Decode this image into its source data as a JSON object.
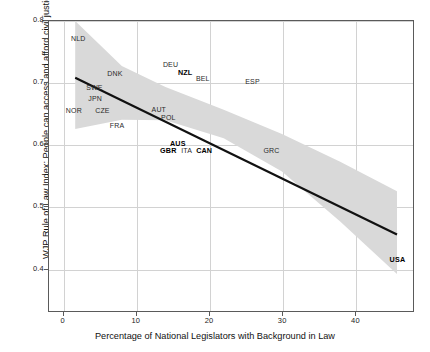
{
  "chart_data": {
    "type": "scatter",
    "title": "",
    "xlabel": "Percentage of National Legislators with Background in Law",
    "ylabel": "WJP Rule of Law Index: People can access and afford civil justice",
    "xlim": [
      -2,
      48
    ],
    "ylim": [
      0.33,
      0.8
    ],
    "xticks": [
      "0",
      "10",
      "20",
      "30",
      "40"
    ],
    "xtick_values": [
      0,
      10,
      20,
      30,
      40
    ],
    "yticks": [
      "0.8",
      "0.7",
      "0.6",
      "0.5",
      "0.4"
    ],
    "ytick_values": [
      0.8,
      0.7,
      0.6,
      0.5,
      0.4
    ],
    "grid": true,
    "legend": "none",
    "points": [
      {
        "label": "NLD",
        "x": 2.0,
        "y": 0.773,
        "bold": false
      },
      {
        "label": "DNK",
        "x": 7.0,
        "y": 0.717,
        "bold": false
      },
      {
        "label": "SWE",
        "x": 4.2,
        "y": 0.693,
        "bold": false
      },
      {
        "label": "JPN",
        "x": 4.3,
        "y": 0.676,
        "bold": false
      },
      {
        "label": "NOR",
        "x": 1.4,
        "y": 0.657,
        "bold": false
      },
      {
        "label": "CZE",
        "x": 5.3,
        "y": 0.657,
        "bold": false
      },
      {
        "label": "FRA",
        "x": 7.3,
        "y": 0.633,
        "bold": false
      },
      {
        "label": "DEU",
        "x": 14.6,
        "y": 0.731,
        "bold": false
      },
      {
        "label": "NZL",
        "x": 16.6,
        "y": 0.718,
        "bold": true
      },
      {
        "label": "BEL",
        "x": 19.0,
        "y": 0.709,
        "bold": false
      },
      {
        "label": "ESP",
        "x": 25.8,
        "y": 0.703,
        "bold": false
      },
      {
        "label": "AUT",
        "x": 13.0,
        "y": 0.658,
        "bold": false
      },
      {
        "label": "POL",
        "x": 14.3,
        "y": 0.645,
        "bold": false
      },
      {
        "label": "AUS",
        "x": 15.6,
        "y": 0.604,
        "bold": true
      },
      {
        "label": "GBR",
        "x": 14.3,
        "y": 0.593,
        "bold": true
      },
      {
        "label": "ITA",
        "x": 16.8,
        "y": 0.593,
        "bold": false
      },
      {
        "label": "CAN",
        "x": 19.2,
        "y": 0.593,
        "bold": true
      },
      {
        "label": "GRC",
        "x": 28.4,
        "y": 0.592,
        "bold": false
      },
      {
        "label": "USA",
        "x": 45.6,
        "y": 0.417,
        "bold": true
      }
    ],
    "fit_line": {
      "name": "linear-regression",
      "x_start": 1.6,
      "y_start": 0.708,
      "x_end": 45.8,
      "y_end": 0.454,
      "color": "#111111"
    },
    "confidence_band": {
      "name": "confidence-interval",
      "color": "#d9d9d9",
      "upper": [
        {
          "x": 1.6,
          "y": 0.8
        },
        {
          "x": 8.0,
          "y": 0.727
        },
        {
          "x": 14.0,
          "y": 0.693
        },
        {
          "x": 22.0,
          "y": 0.656
        },
        {
          "x": 30.0,
          "y": 0.617
        },
        {
          "x": 38.0,
          "y": 0.572
        },
        {
          "x": 45.8,
          "y": 0.524
        }
      ],
      "lower": [
        {
          "x": 1.6,
          "y": 0.625
        },
        {
          "x": 8.0,
          "y": 0.64
        },
        {
          "x": 14.0,
          "y": 0.639
        },
        {
          "x": 22.0,
          "y": 0.61
        },
        {
          "x": 30.0,
          "y": 0.556
        },
        {
          "x": 38.0,
          "y": 0.475
        },
        {
          "x": 45.8,
          "y": 0.39
        }
      ]
    }
  }
}
